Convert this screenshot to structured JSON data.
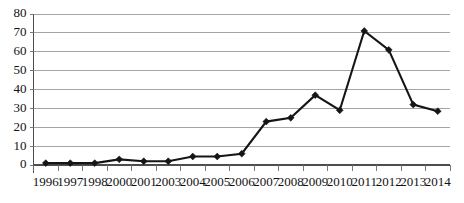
{
  "chart_data": {
    "type": "line",
    "title": "",
    "subtitle": "",
    "xlabel": "",
    "ylabel": "",
    "categories": [
      "1996",
      "1997",
      "1998",
      "2000",
      "2001",
      "2003",
      "2004",
      "2005",
      "2006",
      "2007",
      "2008",
      "2009",
      "2010",
      "2011",
      "2012",
      "2013",
      "2014"
    ],
    "values": [
      1,
      1,
      1,
      3,
      2,
      2,
      4.5,
      4.5,
      6,
      23,
      25,
      37,
      29,
      71,
      61,
      32,
      28.5
    ],
    "series": [
      {
        "name": "",
        "values": [
          1,
          1,
          1,
          3,
          2,
          2,
          4.5,
          4.5,
          6,
          23,
          25,
          37,
          29,
          71,
          61,
          32,
          28.5
        ]
      }
    ],
    "ylim": [
      0,
      80
    ],
    "yticks": [
      0,
      10,
      20,
      30,
      40,
      50,
      60,
      70,
      80
    ],
    "ytick_labels": [
      "0",
      "10",
      "20",
      "30",
      "40",
      "50",
      "60",
      "70",
      "80"
    ],
    "xtick_labels": [
      "1996",
      "1997",
      "1998",
      "2000",
      "2001",
      "2003",
      "2004",
      "2005",
      "2006",
      "2007",
      "2008",
      "2009",
      "2010",
      "2011",
      "2012",
      "2013",
      "2014"
    ],
    "grid": true,
    "grid_axis": "y",
    "legend": false,
    "legend_position": "none",
    "marker": "diamond",
    "annotations": [],
    "colors": {
      "series_line": "#151515",
      "series_marker": "#151515",
      "gridline": "#9a9a9a",
      "axis": "#4d4d4d",
      "background": "#ffffff",
      "tick_text": "#111111"
    }
  }
}
